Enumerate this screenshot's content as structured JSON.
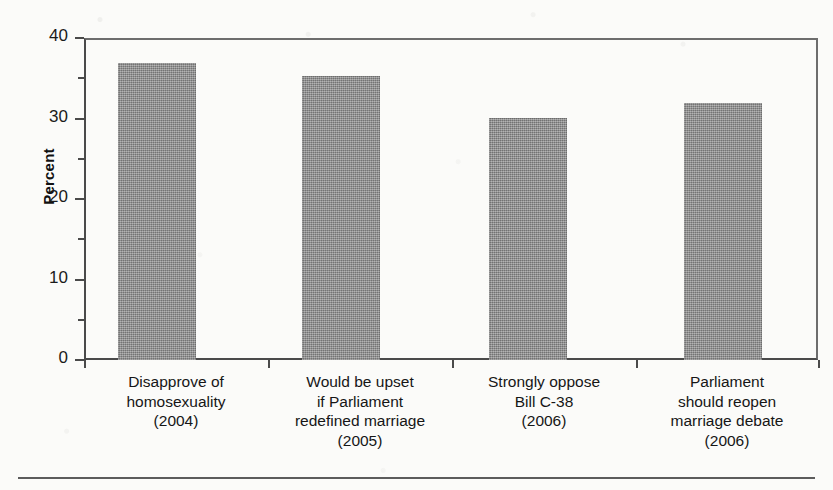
{
  "chart_data": {
    "type": "bar",
    "title": "",
    "subtitle": "",
    "xlabel": "",
    "ylabel": "Percent",
    "ylim": [
      0,
      40
    ],
    "ytick_major": [
      0,
      10,
      20,
      30,
      40
    ],
    "ytick_minor": [
      5,
      15,
      25,
      35
    ],
    "grid": false,
    "legend": false,
    "legend_position": "none",
    "bar_color": "#8d8d8d",
    "axis_color": "#4a4a4a",
    "categories": [
      "Disapprove of homosexuality (2004)",
      "Would be upset if Parliament redefined marriage (2005)",
      "Strongly oppose Bill C-38 (2006)",
      "Parliament should reopen marriage debate (2006)"
    ],
    "category_lines": [
      [
        "Disapprove of",
        "homosexuality",
        "(2004)"
      ],
      [
        "Would be upset",
        "if Parliament",
        "redefined marriage",
        "(2005)"
      ],
      [
        "Strongly oppose",
        "Bill C-38",
        "(2006)"
      ],
      [
        "Parliament",
        "should reopen",
        "marriage debate",
        "(2006)"
      ]
    ],
    "values": [
      36.9,
      35.3,
      30.1,
      31.9
    ]
  },
  "axis": {
    "y_title": "Percent",
    "y_ticks": {
      "t40": "40",
      "t30": "30",
      "t20": "20",
      "t10": "10",
      "t0": "0"
    }
  },
  "x_labels": {
    "cat0": {
      "l0": "Disapprove of",
      "l1": "homosexuality",
      "l2": "(2004)",
      "l3": ""
    },
    "cat1": {
      "l0": "Would be upset",
      "l1": "if Parliament",
      "l2": "redefined marriage",
      "l3": "(2005)"
    },
    "cat2": {
      "l0": "Strongly oppose",
      "l1": "Bill C-38",
      "l2": "(2006)",
      "l3": ""
    },
    "cat3": {
      "l0": "Parliament",
      "l1": "should reopen",
      "l2": "marriage debate",
      "l3": "(2006)"
    }
  }
}
